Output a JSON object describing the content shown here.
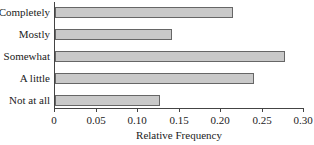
{
  "chart_data": {
    "type": "bar",
    "orientation": "horizontal",
    "title": "",
    "xlabel": "Relative Frequency",
    "ylabel": "",
    "categories": [
      "Completely",
      "Mostly",
      "Somewhat",
      "A little",
      "Not at all"
    ],
    "values": [
      0.215,
      0.141,
      0.277,
      0.24,
      0.127
    ],
    "xlim": [
      0,
      0.3
    ],
    "xticks": [
      "0",
      "0.05",
      "0.10",
      "0.15",
      "0.20",
      "0.25",
      "0.30"
    ],
    "grid": false,
    "legend": null,
    "colors": {
      "bar_fill": "#c9c9c9",
      "bar_border": "#666666",
      "axis": "#444444"
    }
  }
}
